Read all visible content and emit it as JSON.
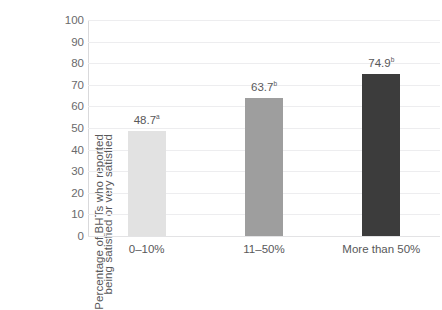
{
  "chart_data": {
    "type": "bar",
    "title": "",
    "xlabel": "",
    "ylabel": "Percentage of BHTs who reported being satisfied or very satisfied",
    "ylabel_lines": [
      "Percentage of BHTs who reported",
      "being satisfied or very satisfied"
    ],
    "categories": [
      "0–10%",
      "11–50%",
      "More than 50%"
    ],
    "values": [
      48.7,
      63.7,
      74.9
    ],
    "value_labels": [
      "48.7",
      "63.7",
      "74.9"
    ],
    "significance_marks": [
      "a",
      "b",
      "b"
    ],
    "bar_colors": [
      "#e2e2e2",
      "#9e9e9e",
      "#3c3c3c"
    ],
    "ylim": [
      0,
      100
    ],
    "yticks": [
      100,
      90,
      80,
      70,
      60,
      50,
      40,
      30,
      20,
      10,
      0
    ],
    "ytick_labels": [
      "100",
      "90",
      "80",
      "70",
      "60",
      "50",
      "40",
      "30",
      "20",
      "10",
      "0"
    ],
    "grid": true,
    "legend": "none",
    "axis_color": "#d9d9db",
    "gridline_color": "#ededef",
    "text_color": "#58585a"
  }
}
